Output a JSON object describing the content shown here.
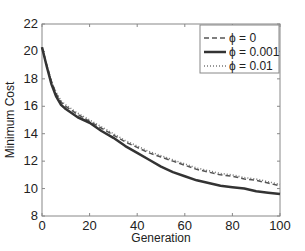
{
  "chart_data": {
    "type": "line",
    "title": "",
    "xlabel": "Generation",
    "ylabel": "Minimum Cost",
    "xlim": [
      0,
      100
    ],
    "ylim": [
      8,
      22
    ],
    "xticks": [
      0,
      20,
      40,
      60,
      80,
      100
    ],
    "yticks": [
      8,
      10,
      12,
      14,
      16,
      18,
      20,
      22
    ],
    "grid": false,
    "legend_position": "upper right",
    "x": [
      0,
      2,
      4,
      6,
      8,
      10,
      15,
      20,
      25,
      30,
      35,
      40,
      45,
      50,
      55,
      60,
      65,
      70,
      75,
      80,
      85,
      90,
      95,
      100
    ],
    "series": [
      {
        "name": "ϕ = 0",
        "style": "dashed",
        "color": "#555555",
        "values": [
          20.3,
          19.0,
          17.8,
          16.9,
          16.3,
          16.0,
          15.4,
          14.9,
          14.4,
          13.9,
          13.4,
          13.0,
          12.6,
          12.3,
          12.0,
          11.7,
          11.4,
          11.2,
          11.0,
          10.9,
          10.7,
          10.6,
          10.4,
          10.2
        ]
      },
      {
        "name": "ϕ = 0.001",
        "style": "solid",
        "color": "#333333",
        "values": [
          20.3,
          18.9,
          17.6,
          16.7,
          16.1,
          15.8,
          15.2,
          14.8,
          14.2,
          13.7,
          13.1,
          12.6,
          12.1,
          11.6,
          11.2,
          10.9,
          10.6,
          10.4,
          10.2,
          10.1,
          10.0,
          9.8,
          9.7,
          9.6
        ]
      },
      {
        "name": "ϕ = 0.01",
        "style": "dotted",
        "color": "#777777",
        "values": [
          20.3,
          19.0,
          17.8,
          17.0,
          16.4,
          16.1,
          15.5,
          15.0,
          14.5,
          14.0,
          13.5,
          13.1,
          12.7,
          12.4,
          12.1,
          11.8,
          11.5,
          11.3,
          11.1,
          11.0,
          10.8,
          10.7,
          10.5,
          10.3
        ]
      }
    ]
  }
}
